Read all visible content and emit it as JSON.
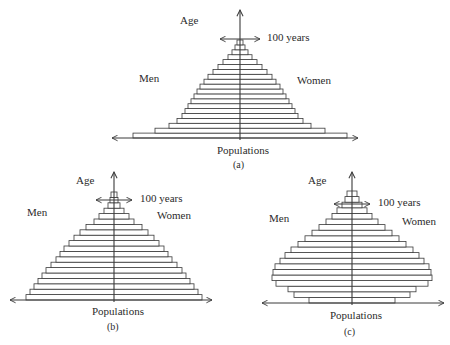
{
  "chart_data": [
    {
      "id": "a",
      "type": "population-pyramid",
      "caption": "(a)",
      "title": "",
      "xlabel": "Populations",
      "ylabel": "Age",
      "left_label": "Men",
      "right_label": "Women",
      "age_marker": "100 years",
      "shape": "expansive (wide base, triangular)",
      "layout": {
        "cx": 240,
        "base_y": 138,
        "bar_h": 4.9,
        "axis_left": 112,
        "axis_right": 358,
        "axis_top": 10,
        "marker_y": 39,
        "marker_half": 20
      },
      "half_widths_bottom_to_top": [
        107,
        85,
        71,
        63,
        58,
        55,
        52,
        49,
        46,
        43,
        40,
        36,
        32,
        27,
        22,
        17,
        12,
        8,
        5,
        3
      ]
    },
    {
      "id": "b",
      "type": "population-pyramid",
      "caption": "(b)",
      "title": "",
      "xlabel": "Populations",
      "ylabel": "Age",
      "left_label": "Men",
      "right_label": "Women",
      "age_marker": "100 years",
      "shape": "stationary (bell-like, gradual taper)",
      "layout": {
        "cx": 114,
        "base_y": 300,
        "bar_h": 5.4,
        "axis_left": 10,
        "axis_right": 212,
        "axis_top": 172,
        "marker_y": 200,
        "marker_half": 18
      },
      "half_widths_bottom_to_top": [
        88,
        84,
        80,
        76,
        72,
        68,
        63,
        58,
        54,
        50,
        45,
        40,
        34,
        28,
        20,
        15,
        10,
        6,
        4,
        3
      ]
    },
    {
      "id": "c",
      "type": "population-pyramid",
      "caption": "(c)",
      "title": "",
      "xlabel": "Populations",
      "ylabel": "Age",
      "left_label": "Men",
      "right_label": "Women",
      "age_marker": "100 years",
      "shape": "constrictive (narrow base, bulge in middle ages)",
      "layout": {
        "cx": 352,
        "base_y": 303,
        "bar_h": 5.6,
        "axis_left": 262,
        "axis_right": 444,
        "axis_top": 172,
        "marker_y": 204,
        "marker_half": 18
      },
      "half_widths_bottom_to_top": [
        43,
        58,
        64,
        76,
        80,
        79,
        77,
        72,
        67,
        61,
        54,
        47,
        40,
        33,
        26,
        20,
        15,
        10,
        7,
        5
      ]
    }
  ],
  "labels": {
    "a": {
      "age": "Age",
      "marker": "100 years",
      "men": "Men",
      "women": "Women",
      "populations": "Populations",
      "caption": "(a)"
    },
    "b": {
      "age": "Age",
      "marker": "100 years",
      "men": "Men",
      "women": "Women",
      "populations": "Populations",
      "caption": "(b)"
    },
    "c": {
      "age": "Age",
      "marker": "100 years",
      "men": "Men",
      "women": "Women",
      "populations": "Populations",
      "caption": "(c)"
    }
  },
  "style": {
    "stroke": "#3a3a3a",
    "fill": "#ffffff"
  }
}
